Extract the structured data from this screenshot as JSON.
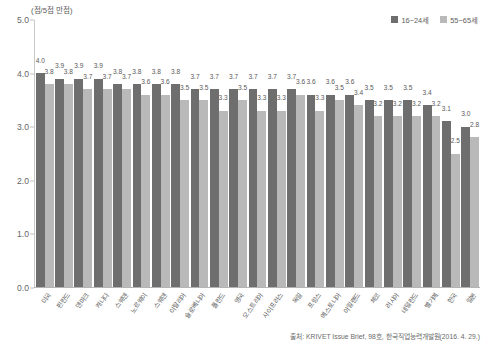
{
  "axis_unit_caption": "(점/5점 만점)",
  "legend": {
    "position": "top-right",
    "items": [
      {
        "label": "16~24세",
        "color": "#6e6e6e",
        "name": "legend-young"
      },
      {
        "label": "55~65세",
        "color": "#b9b9b9",
        "name": "legend-old"
      }
    ]
  },
  "source_note": "출처: KRIVET Issue Brief, 98호, 한국직업능력개발원(2016. 4. 29.)",
  "chart_data": {
    "type": "bar",
    "title": "",
    "subtitle": "",
    "xlabel": "",
    "ylabel": "(점/5점 만점)",
    "ylim": [
      0.0,
      5.0
    ],
    "yticks": [
      "0.0",
      "1.0",
      "2.0",
      "3.0",
      "4.0",
      "5.0"
    ],
    "ytick_values": [
      0.0,
      1.0,
      2.0,
      3.0,
      4.0,
      5.0
    ],
    "grid": false,
    "legend_position": "top-right",
    "categories": [
      "미국",
      "핀란드",
      "덴마크",
      "캐나다",
      "스웨덴",
      "노르웨이",
      "스웨덴",
      "이탈리아",
      "슬로베니아",
      "폴란드",
      "영국",
      "오스트리아",
      "사이프러스",
      "독일",
      "프랑스",
      "에스토니아",
      "아일랜드",
      "체코",
      "러시아",
      "네덜란드",
      "벨기에",
      "한국",
      "일본"
    ],
    "series": [
      {
        "name": "16~24세",
        "color": "#6e6e6e",
        "values": [
          4.0,
          3.9,
          3.9,
          3.9,
          3.8,
          3.8,
          3.8,
          3.8,
          3.7,
          3.7,
          3.7,
          3.7,
          3.7,
          3.7,
          3.6,
          3.6,
          3.6,
          3.5,
          3.5,
          3.5,
          3.4,
          3.1,
          3.0
        ]
      },
      {
        "name": "55~65세",
        "color": "#b9b9b9",
        "values": [
          3.8,
          3.8,
          3.7,
          3.7,
          3.7,
          3.6,
          3.6,
          3.5,
          3.5,
          3.3,
          3.5,
          3.3,
          3.3,
          3.6,
          3.3,
          3.5,
          3.4,
          3.2,
          3.2,
          3.2,
          3.2,
          2.5,
          2.8
        ]
      }
    ],
    "value_labels": {
      "16~24세": [
        "4.0",
        "3.9",
        "3.9",
        "3.9",
        "3.8",
        "3.8",
        "3.8",
        "3.8",
        "3.7",
        "3.7",
        "3.7",
        "3.7",
        "3.7",
        "3.7",
        "3.6",
        "3.6",
        "3.6",
        "3.5",
        "3.5",
        "3.5",
        "3.4",
        "3.1",
        "3.0"
      ],
      "55~65세": [
        "3.8",
        "3.8",
        "3.7",
        "3.7",
        "3.7",
        "3.6",
        "3.6",
        "3.5",
        "3.5",
        "3.3",
        "3.5",
        "3.3",
        "3.3",
        "3.6",
        "3.3",
        "3.5",
        "3.4",
        "3.2",
        "3.2",
        "3.2",
        "3.2",
        "2.5",
        "2.8"
      ]
    }
  }
}
